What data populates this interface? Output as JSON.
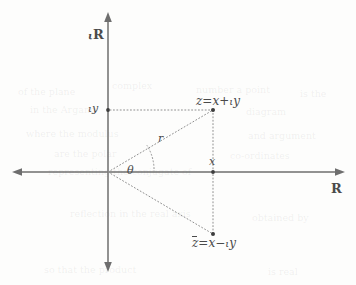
{
  "figure": {
    "background_color": "#fdfdfc",
    "ink_color": "#4a4a4a",
    "axis_color": "#6e6e6e",
    "dotted_color": "#8a8a8a"
  },
  "axes": {
    "imaginary_label": "R",
    "imaginary_prefix": "ι",
    "real_label": "R",
    "origin": {
      "x": 108,
      "y": 172
    },
    "vertical": {
      "top_y": 12,
      "bottom_y": 272,
      "x": 108
    },
    "horizontal": {
      "left_x": 12,
      "right_x": 345,
      "y": 172
    }
  },
  "points": [
    {
      "id": "z",
      "label_main": "z",
      "label_equals": "=",
      "label_real": "x",
      "label_operator": "+",
      "label_imag_unit": "ι",
      "label_imag": "y",
      "label_full": "z = x + ιy",
      "x": 213,
      "y": 110,
      "conjugate": false
    },
    {
      "id": "z-bar",
      "label_main": "z",
      "label_equals": "=",
      "label_real": "x",
      "label_operator": "−",
      "label_imag_unit": "ι",
      "label_imag": "y",
      "label_full": "z̄ = x − ιy",
      "x": 213,
      "y": 234,
      "conjugate": true
    }
  ],
  "tick_labels": {
    "imaginary_value_unit": "ι",
    "imaginary_value": "y",
    "imaginary_value_full": "ιy",
    "real_value": "x"
  },
  "annotations": {
    "radius_label": "r",
    "angle_label": "θ",
    "radius_position": {
      "x": 160,
      "y": 141
    },
    "angle_position": {
      "x": 131,
      "y": 176
    }
  },
  "geometry": {
    "arc_radius": 46,
    "dot_radius": 2.0,
    "dash_pattern": "1 2.4"
  },
  "bleed_through_artifacts": [
    {
      "text": "of the plane",
      "x": 18,
      "y": 86,
      "size": 9.5
    },
    {
      "text": "complex",
      "x": 112,
      "y": 80,
      "size": 9.5
    },
    {
      "text": "number a point",
      "x": 196,
      "y": 84,
      "size": 9.5
    },
    {
      "text": "is the",
      "x": 300,
      "y": 88,
      "size": 9.5
    },
    {
      "text": "in the Argand",
      "x": 30,
      "y": 104,
      "size": 9.5
    },
    {
      "text": "diagram",
      "x": 246,
      "y": 106,
      "size": 9.5
    },
    {
      "text": "where the modulus",
      "x": 26,
      "y": 128,
      "size": 9.5
    },
    {
      "text": "and argument",
      "x": 248,
      "y": 130,
      "size": 9.5
    },
    {
      "text": "are the polar",
      "x": 54,
      "y": 148,
      "size": 9.5
    },
    {
      "text": "co-ordinates",
      "x": 230,
      "y": 150,
      "size": 9.5
    },
    {
      "text": "representing the conjugate of",
      "x": 48,
      "y": 166,
      "size": 9.5
    },
    {
      "text": "reflection in the real axis",
      "x": 70,
      "y": 208,
      "size": 9.5
    },
    {
      "text": "obtained by",
      "x": 252,
      "y": 212,
      "size": 9.5
    },
    {
      "text": "so that the product",
      "x": 44,
      "y": 264,
      "size": 9.5
    },
    {
      "text": "is real",
      "x": 268,
      "y": 266,
      "size": 9.5
    }
  ]
}
